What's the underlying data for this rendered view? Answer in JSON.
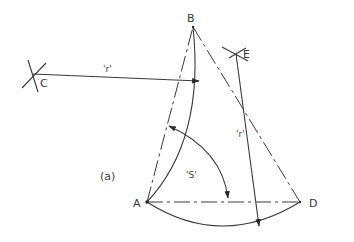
{
  "figure": {
    "subfigure_label": "(a)",
    "points": {
      "A": "A",
      "B": "B",
      "C": "C",
      "D": "D",
      "E": "E"
    },
    "radius_label_1": "'r'",
    "radius_label_2": "'r'",
    "arc_label": "'S'",
    "line_color": "#3a3a3a"
  }
}
